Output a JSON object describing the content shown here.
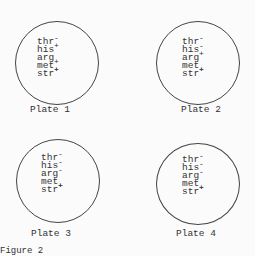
{
  "figure": {
    "caption": "Figure 2",
    "plates": [
      {
        "label": "Plate 1",
        "genes": [
          {
            "name": "thr",
            "marker": "-",
            "pos": "up"
          },
          {
            "name": "his",
            "marker": "+",
            "pos": "up"
          },
          {
            "name": "arg",
            "marker": "+",
            "pos": "dn"
          },
          {
            "name": "met",
            "marker": "+",
            "pos": "dn"
          },
          {
            "name": "str",
            "marker": "+",
            "pos": "up"
          }
        ]
      },
      {
        "label": "Plate 2",
        "genes": [
          {
            "name": "thr",
            "marker": "-",
            "pos": "up"
          },
          {
            "name": "his",
            "marker": "-",
            "pos": "up"
          },
          {
            "name": "arg",
            "marker": "+",
            "pos": "up"
          },
          {
            "name": "met",
            "marker": "+",
            "pos": "dn"
          },
          {
            "name": "str",
            "marker": "+",
            "pos": "up"
          }
        ]
      },
      {
        "label": "Plate 3",
        "genes": [
          {
            "name": "thr",
            "marker": "-",
            "pos": "up"
          },
          {
            "name": "his",
            "marker": "-",
            "pos": "up"
          },
          {
            "name": "arg",
            "marker": "-",
            "pos": "up"
          },
          {
            "name": "met",
            "marker": "+",
            "pos": "dn"
          },
          {
            "name": "str",
            "marker": "+",
            "pos": "up"
          }
        ]
      },
      {
        "label": "Plate 4",
        "genes": [
          {
            "name": "thr",
            "marker": "-",
            "pos": "up"
          },
          {
            "name": "his",
            "marker": "-",
            "pos": "up"
          },
          {
            "name": "arg",
            "marker": "-",
            "pos": "up"
          },
          {
            "name": "met",
            "marker": "+",
            "pos": "dn"
          },
          {
            "name": "str",
            "marker": "+",
            "pos": "up"
          }
        ]
      }
    ]
  }
}
